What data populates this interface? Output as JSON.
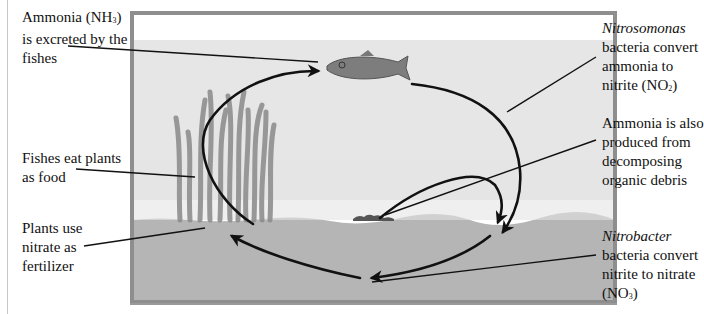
{
  "colors": {
    "frame": "#8e8e8e",
    "water": "#e6e6e6",
    "air": "#ffffff",
    "sand": "#b5b5b5",
    "plants": "#8a8a8a",
    "fish": "#7d7d7d",
    "arrows": "#111111",
    "text": "#111111"
  },
  "labels": {
    "ammonia_excreted": {
      "line1_a": "Ammonia (NH",
      "line1_sub": "3",
      "line1_b": ")",
      "line2": "is excreted by the",
      "line3": "fishes"
    },
    "fishes_eat": {
      "line1": "Fishes eat plants",
      "line2": "as food"
    },
    "plants_use": {
      "line1": "Plants use",
      "line2": "nitrate as",
      "line3": "fertilizer"
    },
    "nitrosomonas": {
      "line1_italic": "Nitrosomonas",
      "line2": "bacteria convert",
      "line3": "ammonia to",
      "line4_a": "nitrite (NO",
      "line4_sub": "2",
      "line4_b": ")"
    },
    "ammonia_debris": {
      "line1": "Ammonia is also",
      "line2": "produced from",
      "line3": "decomposing",
      "line4": "organic debris"
    },
    "nitrobacter": {
      "line1_italic": "Nitrobacter",
      "line2": "bacteria convert",
      "line3": "nitrite to nitrate",
      "line4_a": "(NO",
      "line4_sub": "3",
      "line4_b": ")"
    }
  },
  "icons": {
    "fish": "fish-icon",
    "plants": "seaweed-icon",
    "debris": "organic-debris-icon"
  }
}
